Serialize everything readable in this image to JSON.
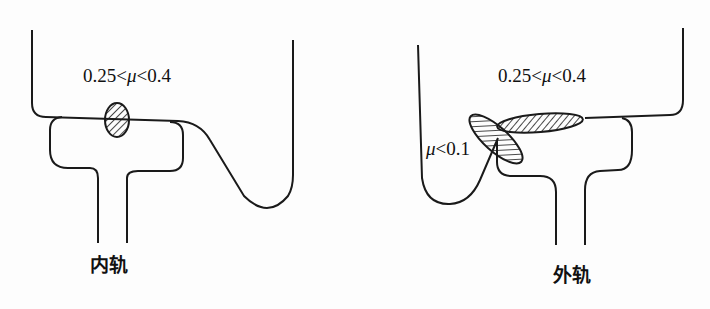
{
  "figure": {
    "panels": [
      {
        "id": "inner-rail",
        "caption": "内轨",
        "contact_zones": [
          {
            "label_prefix": "0.25<",
            "label_symbol": "μ",
            "label_suffix": "<0.4",
            "shape": "hatched-ellipse"
          }
        ]
      },
      {
        "id": "outer-rail",
        "caption": "外轨",
        "contact_zones": [
          {
            "label_prefix": "0.25<",
            "label_symbol": "μ",
            "label_suffix": "<0.4",
            "shape": "hatched-ellipse"
          },
          {
            "label_prefix": "",
            "label_symbol": "μ",
            "label_suffix": "<0.1",
            "shape": "hatched-ellipse"
          }
        ]
      }
    ],
    "colors": {
      "line": "#1a1a1a",
      "background": "#fdfdfd"
    }
  }
}
